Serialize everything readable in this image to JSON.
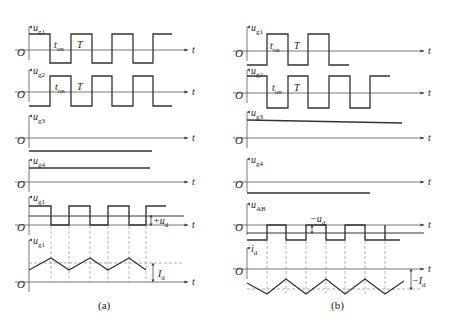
{
  "figure": {
    "colors": {
      "wave": "#333333",
      "axis": "#555555",
      "dashed": "#999999",
      "text": "#222222"
    },
    "panels": [
      {
        "id": "a",
        "caption": "(a)",
        "caption_pos": [
          98,
          309
        ],
        "axis_x": 29,
        "axis_end": 188,
        "rows": [
          {
            "name": "ug1",
            "label": "u",
            "sub": "g1",
            "axis_y": 50,
            "label_y": 31,
            "wave": [
              [
                29,
                34
              ],
              [
                50,
                34
              ],
              [
                50,
                63
              ],
              [
                71,
                63
              ],
              [
                71,
                34
              ],
              [
                92,
                34
              ],
              [
                92,
                63
              ],
              [
                112,
                63
              ],
              [
                112,
                34
              ],
              [
                133,
                34
              ],
              [
                133,
                63
              ],
              [
                153,
                63
              ],
              [
                153,
                34
              ],
              [
                172,
                34
              ]
            ],
            "texts": [
              {
                "t": "t",
                "s": "on",
                "x": 54,
                "y": 48
              },
              {
                "t": "T",
                "s": "",
                "x": 77,
                "y": 48
              }
            ]
          },
          {
            "name": "ug2",
            "label": "u",
            "sub": "g2",
            "axis_y": 92,
            "label_y": 74,
            "wave": [
              [
                29,
                106
              ],
              [
                50,
                106
              ],
              [
                50,
                76
              ],
              [
                71,
                76
              ],
              [
                71,
                106
              ],
              [
                92,
                106
              ],
              [
                92,
                76
              ],
              [
                112,
                76
              ],
              [
                112,
                106
              ],
              [
                133,
                106
              ],
              [
                133,
                76
              ],
              [
                153,
                76
              ],
              [
                153,
                106
              ],
              [
                172,
                106
              ]
            ],
            "texts": [
              {
                "t": "t",
                "s": "on",
                "x": 55,
                "y": 90
              },
              {
                "t": "T",
                "s": "",
                "x": 77,
                "y": 90
              }
            ]
          },
          {
            "name": "ug3",
            "label": "u",
            "sub": "g3",
            "axis_y": 138,
            "label_y": 120,
            "wave": [
              [
                29,
                151
              ],
              [
                152,
                151
              ]
            ],
            "texts": []
          },
          {
            "name": "ug4",
            "label": "u",
            "sub": "g4",
            "axis_y": 182,
            "label_y": 164,
            "wave": [
              [
                29,
                168
              ],
              [
                150,
                168
              ]
            ],
            "texts": []
          },
          {
            "name": "uAB",
            "label": "u",
            "sub": "g1",
            "axis_y": 225,
            "label_y": 201,
            "wave": [
              [
                29,
                206
              ],
              [
                51,
                206
              ],
              [
                51,
                225
              ],
              [
                69,
                225
              ],
              [
                69,
                206
              ],
              [
                90,
                206
              ],
              [
                90,
                225
              ],
              [
                108,
                225
              ],
              [
                108,
                206
              ],
              [
                129,
                206
              ],
              [
                129,
                225
              ],
              [
                146,
                225
              ],
              [
                146,
                206
              ],
              [
                166,
                206
              ]
            ],
            "level": {
              "y": 216,
              "x1": 29,
              "x2": 184
            },
            "texts": [
              {
                "t": "+u",
                "s": "d",
                "x": 153,
                "y": 224
              }
            ],
            "marker": {
              "x": 151,
              "y1": 216,
              "y2": 225
            }
          },
          {
            "name": "id",
            "label": "u",
            "sub": "g1",
            "axis_y": 282,
            "label_y": 244,
            "wave": [
              [
                29,
                270
              ],
              [
                51,
                258
              ],
              [
                69,
                270
              ],
              [
                90,
                258
              ],
              [
                108,
                270
              ],
              [
                129,
                258
              ],
              [
                146,
                270
              ]
            ],
            "dashed_level": {
              "y": 263,
              "x1": 29,
              "x2": 184
            },
            "texts": [
              {
                "t": "I",
                "s": "d",
                "x": 158,
                "y": 277
              }
            ],
            "marker": {
              "x": 153,
              "y1": 264,
              "y2": 281
            }
          }
        ],
        "dashed_verticals": {
          "xs": [
            51,
            69,
            90,
            108,
            129,
            146
          ],
          "y1": 206,
          "y2": 282
        }
      },
      {
        "id": "b",
        "caption": "(b)",
        "caption_pos": [
          331,
          309
        ],
        "axis_x": 247,
        "axis_end": 424,
        "rows": [
          {
            "name": "ug1",
            "label": "u",
            "sub": "g1",
            "axis_y": 51,
            "label_y": 31,
            "wave": [
              [
                247,
                65
              ],
              [
                267,
                65
              ],
              [
                267,
                34
              ],
              [
                288,
                34
              ],
              [
                288,
                65
              ],
              [
                308,
                65
              ],
              [
                308,
                34
              ],
              [
                329,
                34
              ],
              [
                329,
                65
              ],
              [
                349,
                65
              ]
            ],
            "texts": [
              {
                "t": "t",
                "s": "on",
                "x": 270,
                "y": 49
              },
              {
                "t": "T",
                "s": "",
                "x": 294,
                "y": 49
              }
            ]
          },
          {
            "name": "ug2",
            "label": "u",
            "sub": "g2",
            "axis_y": 93,
            "label_y": 74,
            "wave": [
              [
                247,
                76
              ],
              [
                267,
                76
              ],
              [
                267,
                108
              ],
              [
                288,
                108
              ],
              [
                288,
                76
              ],
              [
                308,
                76
              ],
              [
                308,
                108
              ],
              [
                329,
                108
              ],
              [
                329,
                76
              ],
              [
                350,
                76
              ],
              [
                350,
                108
              ],
              [
                370,
                108
              ],
              [
                370,
                76
              ],
              [
                390,
                76
              ]
            ],
            "texts": [
              {
                "t": "t",
                "s": "on",
                "x": 272,
                "y": 91
              },
              {
                "t": "T",
                "s": "",
                "x": 294,
                "y": 91
              }
            ]
          },
          {
            "name": "ug3",
            "label": "u",
            "sub": "g3",
            "axis_y": 138,
            "label_y": 116,
            "wave": [
              [
                247,
                120
              ],
              [
                402,
                123
              ]
            ],
            "texts": []
          },
          {
            "name": "ug4",
            "label": "u",
            "sub": "g4",
            "axis_y": 182,
            "label_y": 163,
            "wave": [
              [
                247,
                193
              ],
              [
                370,
                193
              ]
            ],
            "texts": []
          },
          {
            "name": "uAB",
            "label": "u",
            "sub": "AB",
            "axis_y": 225,
            "label_y": 208,
            "wave": [
              [
                247,
                240
              ],
              [
                267,
                240
              ],
              [
                267,
                225
              ],
              [
                286,
                225
              ],
              [
                286,
                240
              ],
              [
                306,
                240
              ],
              [
                306,
                225
              ],
              [
                326,
                225
              ],
              [
                326,
                240
              ],
              [
                345,
                240
              ],
              [
                345,
                225
              ],
              [
                365,
                225
              ],
              [
                365,
                240
              ],
              [
                385,
                240
              ],
              [
                385,
                225
              ],
              [
                385,
                240
              ],
              [
                400,
                240
              ]
            ],
            "level": {
              "y": 233,
              "x1": 247,
              "x2": 424
            },
            "texts": [
              {
                "t": "−u",
                "s": "d",
                "x": 310,
                "y": 222
              }
            ],
            "marker": {
              "x": 312,
              "y1": 226,
              "y2": 233
            }
          },
          {
            "name": "id",
            "label": "i",
            "sub": "d",
            "axis_y": 269,
            "label_y": 252,
            "wave": [
              [
                247,
                283
              ],
              [
                267,
                294
              ],
              [
                286,
                279
              ],
              [
                306,
                294
              ],
              [
                326,
                279
              ],
              [
                345,
                294
              ],
              [
                365,
                279
              ],
              [
                385,
                294
              ],
              [
                404,
                281
              ]
            ],
            "dashed_level": {
              "y": 289,
              "x1": 247,
              "x2": 420
            },
            "texts": [
              {
                "t": "−I",
                "s": "d",
                "x": 412,
                "y": 284
              }
            ],
            "marker": {
              "x": 411,
              "y1": 270,
              "y2": 289
            }
          }
        ],
        "dashed_verticals": {
          "xs": [
            267,
            286,
            306,
            326,
            345,
            365,
            385
          ],
          "y1": 226,
          "y2": 294
        }
      }
    ],
    "origin_label": "O",
    "time_label": "t"
  }
}
